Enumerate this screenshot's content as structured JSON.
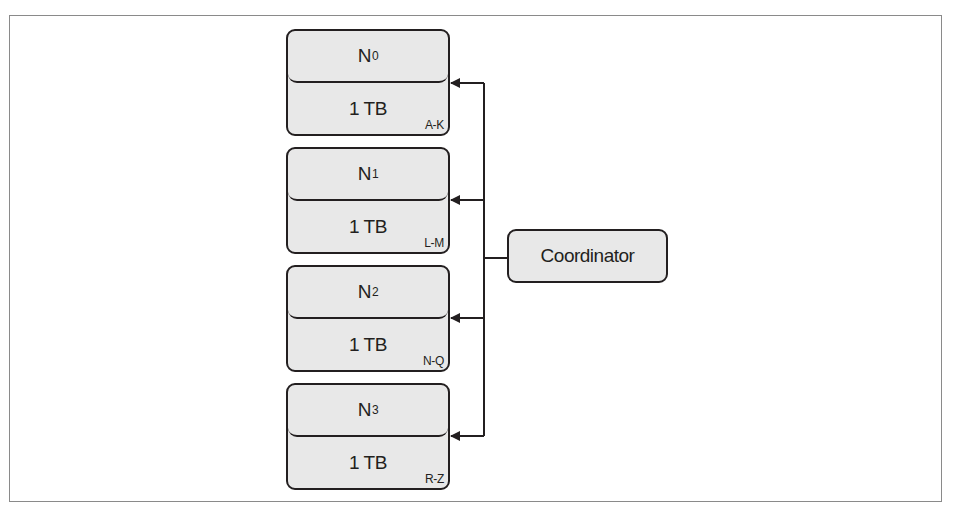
{
  "diagram": {
    "type": "sharded-storage",
    "coordinator": {
      "label": "Coordinator"
    },
    "nodes": [
      {
        "name": "N",
        "sub": "0",
        "capacity": "1 TB",
        "range": "A-K"
      },
      {
        "name": "N",
        "sub": "1",
        "capacity": "1 TB",
        "range": "L-M"
      },
      {
        "name": "N",
        "sub": "2",
        "capacity": "1 TB",
        "range": "N-Q"
      },
      {
        "name": "N",
        "sub": "3",
        "capacity": "1 TB",
        "range": "R-Z"
      }
    ],
    "edges": [
      {
        "from": "Coordinator",
        "to": "N0",
        "arrow": "to"
      },
      {
        "from": "Coordinator",
        "to": "N1",
        "arrow": "to"
      },
      {
        "from": "Coordinator",
        "to": "N2",
        "arrow": "to"
      },
      {
        "from": "Coordinator",
        "to": "N3",
        "arrow": "to"
      }
    ],
    "colors": {
      "stroke": "#231f20",
      "fill": "#e8e8e8",
      "frame": "#8a8a8a"
    }
  }
}
